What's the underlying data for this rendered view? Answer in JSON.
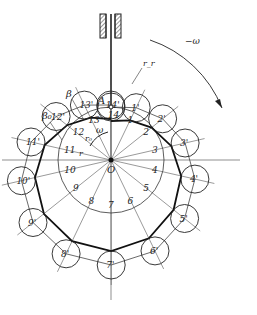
{
  "diagram": {
    "type": "cam-roller-follower-construction",
    "colors": {
      "ink": "#222222",
      "thin": "#444444",
      "background": "#ffffff"
    },
    "center_label": "O",
    "contact_label": "A",
    "omega_label": "ω",
    "reverse_omega_label": "−ω",
    "roller_radius_label": "r_r",
    "base_radius_label": "r₀",
    "r_label": "r",
    "pitch_curve_label": "β",
    "base_pitch_label": "β₀",
    "division_labels": [
      "1",
      "2",
      "3",
      "4",
      "5",
      "6",
      "7",
      "8",
      "9",
      "10",
      "11",
      "12",
      "13",
      "14"
    ],
    "roller_labels": [
      "1'",
      "2'",
      "3'",
      "4'",
      "5'",
      "6'",
      "7'",
      "8'",
      "9'",
      "10'",
      "11'",
      "12'",
      "13'",
      "14'"
    ]
  }
}
